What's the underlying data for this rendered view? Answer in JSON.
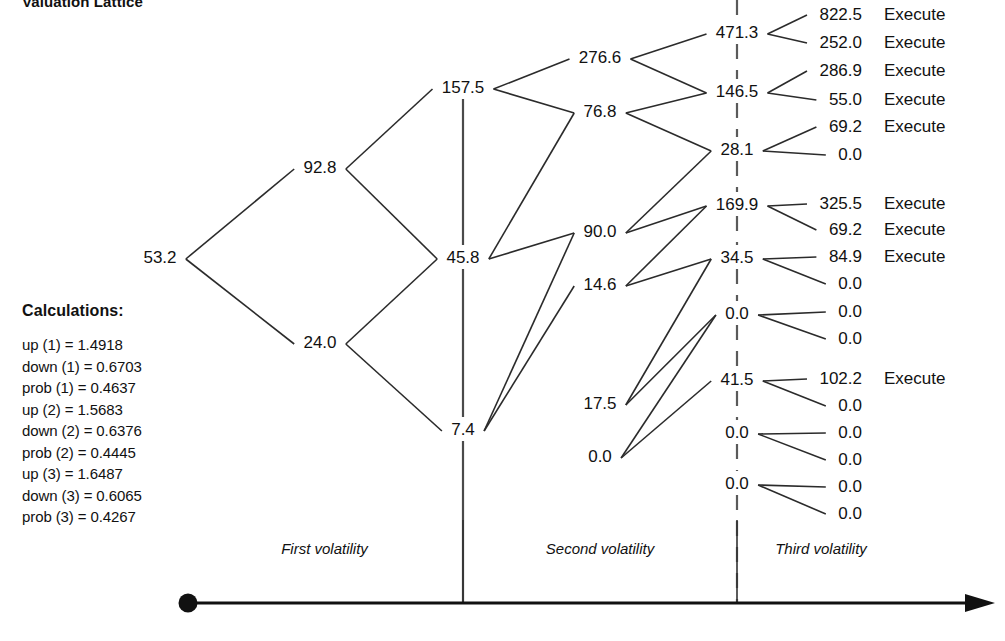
{
  "title": "Valuation Lattice",
  "calculations": {
    "heading": "Calculations:",
    "lines": [
      "up (1) = 1.4918",
      "down (1) = 0.6703",
      "prob (1) = 0.4637",
      "up (2) = 1.5683",
      "down (2) = 0.6376",
      "prob (2) = 0.4445",
      "up (3) = 1.6487",
      "down (3) = 0.6065",
      "prob (3) = 0.4267"
    ]
  },
  "axis": {
    "phases": [
      {
        "label": "First volatility"
      },
      {
        "label": "Second volatility"
      },
      {
        "label": "Third volatility"
      }
    ],
    "origin_marker": "origin-dot",
    "arrow_marker": "right-arrowhead"
  },
  "chart_data": {
    "type": "diagram",
    "subtype": "recombining-binomial-lattice",
    "title": "Valuation Lattice",
    "steps": 4,
    "execute_label": "Execute",
    "columns": [
      {
        "name": "root",
        "x": 160,
        "nodes": [
          {
            "value": "53.2",
            "y": 263
          }
        ]
      },
      {
        "name": "step-1",
        "x": 320,
        "nodes": [
          {
            "value": "92.8",
            "y": 173
          },
          {
            "value": "24.0",
            "y": 348
          }
        ]
      },
      {
        "name": "step-2",
        "x": 463,
        "nodes": [
          {
            "value": "157.5",
            "y": 93
          },
          {
            "value": "45.8",
            "y": 263
          },
          {
            "value": "7.4",
            "y": 435
          }
        ]
      },
      {
        "name": "step-3",
        "x": 600,
        "nodes": [
          {
            "value": "276.6",
            "y": 63
          },
          {
            "value": "76.8",
            "y": 117
          },
          {
            "value": "90.0",
            "y": 237
          },
          {
            "value": "14.6",
            "y": 290
          },
          {
            "value": "17.5",
            "y": 409
          },
          {
            "value": "0.0",
            "y": 462
          }
        ]
      },
      {
        "name": "step-4",
        "x": 737,
        "nodes": [
          {
            "value": "471.3",
            "y": 38
          },
          {
            "value": "146.5",
            "y": 97
          },
          {
            "value": "28.1",
            "y": 155
          },
          {
            "value": "169.9",
            "y": 210
          },
          {
            "value": "34.5",
            "y": 263
          },
          {
            "value": "0.0",
            "y": 319
          },
          {
            "value": "41.5",
            "y": 385
          },
          {
            "value": "0.0",
            "y": 438
          },
          {
            "value": "0.0",
            "y": 489
          }
        ]
      }
    ],
    "terminals": [
      {
        "value": "822.5",
        "tag": "Execute",
        "y": 20
      },
      {
        "value": "252.0",
        "tag": "Execute",
        "y": 48
      },
      {
        "value": "286.9",
        "tag": "Execute",
        "y": 76
      },
      {
        "value": "55.0",
        "tag": "Execute",
        "y": 105
      },
      {
        "value": "69.2",
        "tag": "Execute",
        "y": 132
      },
      {
        "value": "0.0",
        "tag": "",
        "y": 160
      },
      {
        "value": "325.5",
        "tag": "Execute",
        "y": 209
      },
      {
        "value": "69.2",
        "tag": "Execute",
        "y": 235
      },
      {
        "value": "84.9",
        "tag": "Execute",
        "y": 262
      },
      {
        "value": "0.0",
        "tag": "",
        "y": 289
      },
      {
        "value": "0.0",
        "tag": "",
        "y": 317
      },
      {
        "value": "0.0",
        "tag": "",
        "y": 344
      },
      {
        "value": "102.2",
        "tag": "Execute",
        "y": 384
      },
      {
        "value": "0.0",
        "tag": "",
        "y": 411
      },
      {
        "value": "0.0",
        "tag": "",
        "y": 438
      },
      {
        "value": "0.0",
        "tag": "",
        "y": 465
      },
      {
        "value": "0.0",
        "tag": "",
        "y": 492
      },
      {
        "value": "0.0",
        "tag": "",
        "y": 519
      }
    ]
  },
  "colors": {
    "ink": "#111111",
    "edge": "#2b2b2b",
    "spine": "#4a4a4a",
    "background": "#ffffff"
  }
}
